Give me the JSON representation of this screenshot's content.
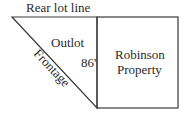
{
  "diagram": {
    "labels": {
      "rear_lot_line": "Rear lot line",
      "outlot": "Outlot",
      "dimension": "86'",
      "property_line1": "Robinson",
      "property_line2": "Property",
      "frontage": "Frontage"
    },
    "colors": {
      "line": "#3a3a3a",
      "text": "#2a2a2a",
      "background": "#ffffff"
    }
  }
}
